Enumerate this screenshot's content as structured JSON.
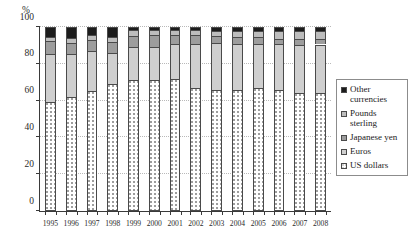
{
  "chart_data": {
    "type": "bar",
    "stacked": true,
    "stack_total": 100,
    "title": "",
    "subtitle": "",
    "xlabel": "",
    "ylabel": "%",
    "unit_label": "%",
    "ylim": [
      0,
      100
    ],
    "yticks": [
      0,
      20,
      40,
      60,
      80,
      100
    ],
    "ytick_labels": [
      "0",
      "20",
      "40",
      "60",
      "80",
      "100"
    ],
    "grid": true,
    "grid_axis": "y",
    "legend_position": "right",
    "categories": [
      "1995",
      "1996",
      "1997",
      "1998",
      "1999",
      "2000",
      "2001",
      "2002",
      "2003",
      "2004",
      "2005",
      "2006",
      "2007",
      "2008"
    ],
    "series": [
      {
        "name": "US dollars",
        "color": "#ffffff",
        "pattern": "dotted",
        "values": [
          59.0,
          62.0,
          65.2,
          69.3,
          71.0,
          71.1,
          71.5,
          67.1,
          65.9,
          65.9,
          66.9,
          65.5,
          64.1,
          64.0
        ]
      },
      {
        "name": "Euros",
        "color": "#cfcfcf",
        "values": [
          26.6,
          23.5,
          21.8,
          16.6,
          17.9,
          18.3,
          19.2,
          23.8,
          25.2,
          24.8,
          23.9,
          25.1,
          26.3,
          26.5
        ]
      },
      {
        "name": "Japanese yen",
        "color": "#9d9d9d",
        "values": [
          6.8,
          6.0,
          5.8,
          6.2,
          6.4,
          6.1,
          5.1,
          4.5,
          3.9,
          3.8,
          3.6,
          3.1,
          2.9,
          3.1
        ]
      },
      {
        "name": "Pounds sterling",
        "color": "#bdbdbd",
        "values": [
          2.1,
          2.7,
          2.6,
          2.7,
          2.9,
          2.8,
          2.7,
          2.8,
          2.8,
          3.4,
          3.6,
          4.4,
          4.7,
          4.0
        ]
      },
      {
        "name": "Other currencies",
        "color": "#1c1c1c",
        "values": [
          5.5,
          5.8,
          4.6,
          5.2,
          1.8,
          1.7,
          1.5,
          1.8,
          2.2,
          2.1,
          2.0,
          1.9,
          2.0,
          2.4
        ]
      }
    ]
  },
  "legend": {
    "items": [
      {
        "label": "Other currencies",
        "swatch": "#1c1c1c"
      },
      {
        "label": "Pounds sterling",
        "swatch": "#bdbdbd"
      },
      {
        "label": "Japanese yen",
        "swatch": "#9d9d9d"
      },
      {
        "label": "Euros",
        "swatch": "#cfcfcf"
      },
      {
        "label": "US dollars",
        "swatch": "#ffffff"
      }
    ]
  }
}
